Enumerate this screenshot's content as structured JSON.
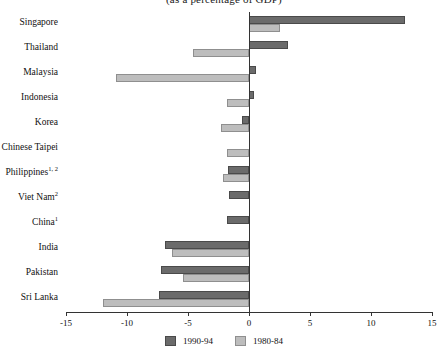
{
  "chart_data": {
    "type": "bar",
    "orientation": "horizontal",
    "title": "(as a percentage of GDP)",
    "xlabel": "",
    "ylabel": "",
    "xlim": [
      -15,
      15
    ],
    "xticks": [
      -15,
      -10,
      -5,
      0,
      5,
      10,
      15
    ],
    "xtick_labels": [
      "-15",
      "-10",
      "-5",
      "0",
      "5",
      "10",
      "15"
    ],
    "grid": false,
    "legend_position": "bottom-center",
    "categories": [
      "Singapore",
      "Thailand",
      "Malaysia",
      "Indonesia",
      "Korea",
      "Chinese Taipei",
      "Philippines",
      "Viet Nam",
      "China",
      "India",
      "Pakistan",
      "Sri Lanka"
    ],
    "category_footnotes": [
      "",
      "",
      "",
      "",
      "",
      "",
      "1, 2",
      "2",
      "1",
      "",
      "",
      ""
    ],
    "series": [
      {
        "name": "1990-94",
        "color": "#6b6b6b",
        "values": [
          12.8,
          3.2,
          0.6,
          0.4,
          -0.6,
          0.0,
          -1.7,
          -1.6,
          -1.8,
          -6.9,
          -7.2,
          -7.4
        ]
      },
      {
        "name": "1980-84",
        "color": "#bdbdbd",
        "values": [
          2.5,
          -4.6,
          -10.9,
          -1.8,
          -2.3,
          -1.8,
          -2.1,
          0.0,
          0.0,
          -6.3,
          -5.4,
          -12.0
        ]
      }
    ]
  },
  "legend": {
    "items": [
      {
        "label": "1990-94",
        "color": "#6b6b6b"
      },
      {
        "label": "1980-84",
        "color": "#bdbdbd"
      }
    ]
  }
}
